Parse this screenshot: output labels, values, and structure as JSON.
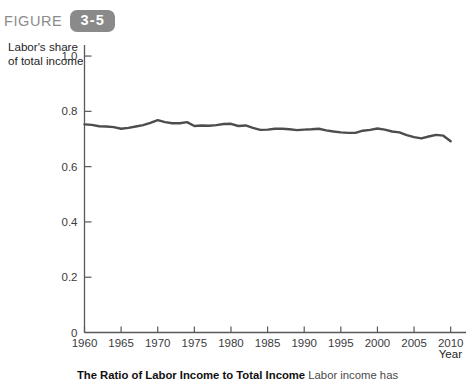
{
  "figure": {
    "word": "FIGURE",
    "number": "3-5",
    "badge_color": "#8a8a8a"
  },
  "axis_titles": {
    "y": "Labor's share\nof total income",
    "x": "Year"
  },
  "caption": {
    "title": "The Ratio of Labor Income to Total Income",
    "body": "Labor income has"
  },
  "chart_data": {
    "type": "line",
    "title": "",
    "xlabel": "Year",
    "ylabel": "Labor's share of total income",
    "xlim": [
      1960,
      2011
    ],
    "ylim": [
      0,
      1.0
    ],
    "grid": false,
    "legend": "none",
    "line_color": "#4d4d4f",
    "yticks": [
      0,
      0.2,
      0.4,
      0.6,
      0.8,
      1.0
    ],
    "ytick_labels": [
      "0",
      "0.2",
      "0.4",
      "0.6",
      "0.8",
      "1.0"
    ],
    "xticks": [
      1960,
      1965,
      1970,
      1975,
      1980,
      1985,
      1990,
      1995,
      2000,
      2005,
      2010
    ],
    "xtick_labels": [
      "1960",
      "1965",
      "1970",
      "1975",
      "1980",
      "1985",
      "1990",
      "1995",
      "2000",
      "2005",
      "2010"
    ],
    "x": [
      1960,
      1961,
      1962,
      1963,
      1964,
      1965,
      1966,
      1967,
      1968,
      1969,
      1970,
      1971,
      1972,
      1973,
      1974,
      1975,
      1976,
      1977,
      1978,
      1979,
      1980,
      1981,
      1982,
      1983,
      1984,
      1985,
      1986,
      1987,
      1988,
      1989,
      1990,
      1991,
      1992,
      1993,
      1994,
      1995,
      1996,
      1997,
      1998,
      1999,
      2000,
      2001,
      2002,
      2003,
      2004,
      2005,
      2006,
      2007,
      2008,
      2009,
      2010
    ],
    "y": [
      0.753,
      0.751,
      0.746,
      0.745,
      0.743,
      0.737,
      0.74,
      0.745,
      0.75,
      0.758,
      0.768,
      0.761,
      0.757,
      0.757,
      0.761,
      0.747,
      0.749,
      0.748,
      0.75,
      0.754,
      0.755,
      0.747,
      0.749,
      0.74,
      0.733,
      0.734,
      0.737,
      0.737,
      0.735,
      0.732,
      0.734,
      0.735,
      0.737,
      0.731,
      0.727,
      0.724,
      0.722,
      0.722,
      0.73,
      0.733,
      0.738,
      0.734,
      0.727,
      0.724,
      0.714,
      0.707,
      0.702,
      0.709,
      0.715,
      0.712,
      0.692
    ]
  }
}
